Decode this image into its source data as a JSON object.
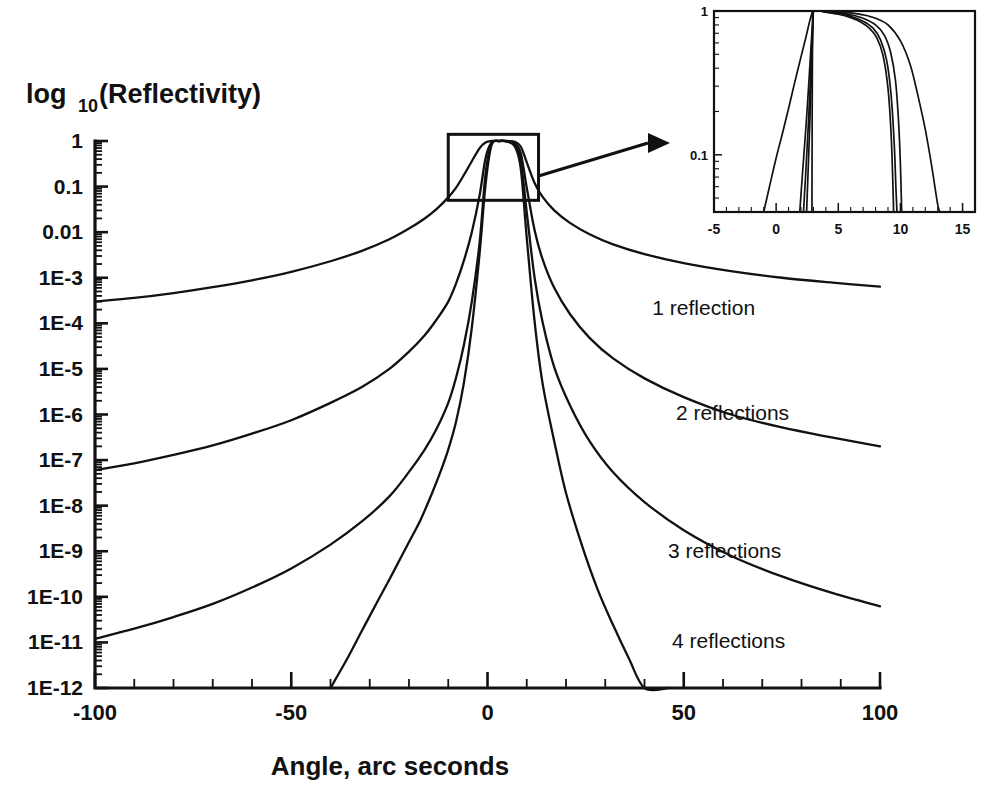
{
  "chart_data": {
    "type": "line",
    "title": "",
    "xlabel": "Angle, arc seconds",
    "ylabel": "log_10(Reflectivity)",
    "ylabel_parts": {
      "base": "log",
      "sub": "10",
      "rest": "(Reflectivity)"
    },
    "xlim": [
      -100,
      100
    ],
    "ylim": [
      1e-12,
      1
    ],
    "yscale": "log",
    "grid": false,
    "legend_position": "inline-annotations",
    "xticks": [
      -100,
      -50,
      0,
      50,
      100
    ],
    "xtick_labels": [
      "-100",
      "-50",
      "0",
      "50",
      "100"
    ],
    "xticks_minor_step": 10,
    "yticks": [
      1,
      0.1,
      0.01,
      0.001,
      0.0001,
      1e-05,
      1e-06,
      1e-07,
      1e-08,
      1e-09,
      1e-10,
      1e-11,
      1e-12
    ],
    "ytick_labels": [
      "1",
      "0.1",
      "0.01",
      "1E-3",
      "1E-4",
      "1E-5",
      "1E-6",
      "1E-7",
      "1E-8",
      "1E-9",
      "1E-10",
      "1E-11",
      "1E-12"
    ],
    "peak_angle": 3.0,
    "series": [
      {
        "name": "1 reflection",
        "label": "1 reflection",
        "label_angle": 42,
        "label_value": 0.00022,
        "points": [
          [
            -100,
            0.0003
          ],
          [
            -90,
            0.00036
          ],
          [
            -80,
            0.00046
          ],
          [
            -70,
            0.00062
          ],
          [
            -60,
            0.00088
          ],
          [
            -50,
            0.00135
          ],
          [
            -40,
            0.0023
          ],
          [
            -32,
            0.0039
          ],
          [
            -25,
            0.007
          ],
          [
            -20,
            0.012
          ],
          [
            -16,
            0.02
          ],
          [
            -13,
            0.032
          ],
          [
            -10,
            0.058
          ],
          [
            -8,
            0.095
          ],
          [
            -6,
            0.18
          ],
          [
            -4,
            0.36
          ],
          [
            -2,
            0.7
          ],
          [
            -0.5,
            0.93
          ],
          [
            1.0,
            1.0
          ],
          [
            3.0,
            1.0
          ],
          [
            5.0,
            1.0
          ],
          [
            7.0,
            0.96
          ],
          [
            8.5,
            0.75
          ],
          [
            10,
            0.34
          ],
          [
            12,
            0.12
          ],
          [
            14,
            0.06
          ],
          [
            17,
            0.03
          ],
          [
            21,
            0.016
          ],
          [
            26,
            0.009
          ],
          [
            32,
            0.0054
          ],
          [
            40,
            0.0033
          ],
          [
            50,
            0.0021
          ],
          [
            62,
            0.0014
          ],
          [
            75,
            0.001
          ],
          [
            88,
            0.00078
          ],
          [
            100,
            0.00064
          ]
        ]
      },
      {
        "name": "2 reflections",
        "label": "2 reflections",
        "label_angle": 48,
        "label_value": 1.1e-06,
        "points": [
          [
            -100,
            6e-08
          ],
          [
            -90,
            8.5e-08
          ],
          [
            -80,
            1.3e-07
          ],
          [
            -70,
            2.1e-07
          ],
          [
            -60,
            3.8e-07
          ],
          [
            -50,
            7.5e-07
          ],
          [
            -40,
            1.8e-06
          ],
          [
            -32,
            4e-06
          ],
          [
            -25,
            1e-05
          ],
          [
            -20,
            2.4e-05
          ],
          [
            -16,
            5.5e-05
          ],
          [
            -13,
            0.00012
          ],
          [
            -10,
            0.0003
          ],
          [
            -8,
            0.00075
          ],
          [
            -6,
            0.0024
          ],
          [
            -4,
            0.01
          ],
          [
            -2,
            0.065
          ],
          [
            -0.5,
            0.42
          ],
          [
            1.0,
            0.92
          ],
          [
            3.0,
            1.0
          ],
          [
            5.0,
            0.99
          ],
          [
            7.0,
            0.9
          ],
          [
            8.5,
            0.53
          ],
          [
            10,
            0.095
          ],
          [
            12,
            0.011
          ],
          [
            14,
            0.0026
          ],
          [
            17,
            0.0006
          ],
          [
            21,
            0.00016
          ],
          [
            26,
            4.8e-05
          ],
          [
            32,
            1.7e-05
          ],
          [
            40,
            6.2e-06
          ],
          [
            50,
            2.4e-06
          ],
          [
            62,
            1e-06
          ],
          [
            75,
            5.2e-07
          ],
          [
            88,
            3.1e-07
          ],
          [
            100,
            2e-07
          ]
        ]
      },
      {
        "name": "3 reflections",
        "label": "3 reflections",
        "label_angle": 46,
        "label_value": 1e-09,
        "points": [
          [
            -100,
            1.2e-11
          ],
          [
            -90,
            2e-11
          ],
          [
            -80,
            3.6e-11
          ],
          [
            -70,
            7e-11
          ],
          [
            -60,
            1.6e-10
          ],
          [
            -50,
            4.2e-10
          ],
          [
            -40,
            1.4e-09
          ],
          [
            -32,
            4.5e-09
          ],
          [
            -25,
            1.6e-08
          ],
          [
            -20,
            5.5e-08
          ],
          [
            -16,
            1.7e-07
          ],
          [
            -13,
            4.8e-07
          ],
          [
            -10,
            1.8e-06
          ],
          [
            -8,
            6.5e-06
          ],
          [
            -6,
            3.4e-05
          ],
          [
            -4,
            0.0003
          ],
          [
            -2,
            0.006
          ],
          [
            -0.5,
            0.19
          ],
          [
            1.0,
            0.85
          ],
          [
            3.0,
            1.0
          ],
          [
            5.0,
            0.98
          ],
          [
            7.0,
            0.83
          ],
          [
            8.5,
            0.37
          ],
          [
            10,
            0.027
          ],
          [
            12,
            0.001
          ],
          [
            14,
            0.00011
          ],
          [
            17,
            1.1e-05
          ],
          [
            21,
            1.6e-06
          ],
          [
            26,
            2.6e-07
          ],
          [
            32,
            5.4e-08
          ],
          [
            40,
            1.2e-08
          ],
          [
            50,
            2.9e-09
          ],
          [
            62,
            8e-10
          ],
          [
            75,
            2.8e-10
          ],
          [
            88,
            1.2e-10
          ],
          [
            100,
            6.2e-11
          ]
        ]
      },
      {
        "name": "4 reflections",
        "label": "4 reflections",
        "label_angle": 47,
        "label_value": 1.1e-11,
        "points": [
          [
            -40,
            1e-12
          ],
          [
            -36,
            4e-12
          ],
          [
            -32,
            1.8e-11
          ],
          [
            -28,
            8e-11
          ],
          [
            -25,
            2.4e-10
          ],
          [
            -22,
            7.5e-10
          ],
          [
            -20,
            1.6e-09
          ],
          [
            -17,
            5e-09
          ],
          [
            -14,
            2e-08
          ],
          [
            -12,
            5.5e-08
          ],
          [
            -10,
            1.7e-07
          ],
          [
            -8,
            7e-07
          ],
          [
            -6,
            5e-06
          ],
          [
            -4,
            8e-05
          ],
          [
            -2,
            0.0035
          ],
          [
            -0.5,
            0.11
          ],
          [
            1.0,
            0.8
          ],
          [
            3.0,
            1.0
          ],
          [
            5.0,
            0.97
          ],
          [
            7.0,
            0.75
          ],
          [
            8.5,
            0.24
          ],
          [
            10,
            0.0075
          ],
          [
            12,
            0.00011
          ],
          [
            14,
            5e-06
          ],
          [
            17,
            2.6e-07
          ],
          [
            20,
            1.9e-08
          ],
          [
            24,
            1.4e-09
          ],
          [
            28,
            1.5e-10
          ],
          [
            32,
            2.4e-11
          ],
          [
            36,
            4.5e-12
          ],
          [
            40,
            1e-12
          ],
          [
            46,
            1e-12
          ]
        ]
      }
    ],
    "zoom_box": {
      "x_range": [
        -10,
        13
      ],
      "y_range": [
        0.05,
        1.4
      ],
      "annotation": "zoom-region"
    },
    "inset": {
      "type": "line",
      "xlim": [
        -5,
        16
      ],
      "ylim": [
        0.04,
        1.0
      ],
      "yscale": "log",
      "xticks": [
        -5,
        0,
        5,
        10,
        15
      ],
      "xtick_labels": [
        "-5",
        "0",
        "5",
        "10",
        "15"
      ],
      "yticks": [
        1,
        0.1
      ],
      "ytick_labels": [
        "1",
        "0.1"
      ],
      "series": [
        {
          "name": "1 reflection",
          "points": [
            [
              -1.0,
              0.04
            ],
            [
              -0.5,
              0.062
            ],
            [
              0.0,
              0.095
            ],
            [
              0.5,
              0.14
            ],
            [
              1.0,
              0.21
            ],
            [
              1.5,
              0.32
            ],
            [
              2.0,
              0.48
            ],
            [
              2.4,
              0.66
            ],
            [
              2.7,
              0.85
            ],
            [
              2.9,
              0.97
            ],
            [
              3.0,
              1.0
            ],
            [
              4.0,
              0.995
            ],
            [
              5.0,
              0.985
            ],
            [
              6.0,
              0.97
            ],
            [
              7.0,
              0.94
            ],
            [
              8.0,
              0.89
            ],
            [
              9.0,
              0.8
            ],
            [
              10.0,
              0.62
            ],
            [
              10.8,
              0.42
            ],
            [
              11.4,
              0.26
            ],
            [
              12.0,
              0.15
            ],
            [
              12.5,
              0.085
            ],
            [
              13.0,
              0.045
            ],
            [
              13.2,
              0.04
            ]
          ]
        },
        {
          "name": "2 reflections",
          "points": [
            [
              1.9,
              0.04
            ],
            [
              2.1,
              0.07
            ],
            [
              2.3,
              0.12
            ],
            [
              2.5,
              0.21
            ],
            [
              2.7,
              0.4
            ],
            [
              2.85,
              0.65
            ],
            [
              2.95,
              0.88
            ],
            [
              3.0,
              1.0
            ],
            [
              4.0,
              0.99
            ],
            [
              5.0,
              0.97
            ],
            [
              6.0,
              0.94
            ],
            [
              7.0,
              0.89
            ],
            [
              8.0,
              0.8
            ],
            [
              8.7,
              0.68
            ],
            [
              9.2,
              0.52
            ],
            [
              9.6,
              0.33
            ],
            [
              9.85,
              0.17
            ],
            [
              10.0,
              0.085
            ],
            [
              10.1,
              0.04
            ]
          ]
        },
        {
          "name": "3 reflections",
          "points": [
            [
              2.2,
              0.04
            ],
            [
              2.4,
              0.08
            ],
            [
              2.6,
              0.17
            ],
            [
              2.75,
              0.32
            ],
            [
              2.87,
              0.58
            ],
            [
              2.95,
              0.85
            ],
            [
              3.0,
              1.0
            ],
            [
              4.0,
              0.985
            ],
            [
              5.0,
              0.96
            ],
            [
              6.0,
              0.92
            ],
            [
              7.0,
              0.85
            ],
            [
              7.8,
              0.76
            ],
            [
              8.4,
              0.63
            ],
            [
              8.9,
              0.45
            ],
            [
              9.25,
              0.26
            ],
            [
              9.5,
              0.12
            ],
            [
              9.65,
              0.055
            ],
            [
              9.72,
              0.04
            ]
          ]
        },
        {
          "name": "4 reflections",
          "points": [
            [
              2.45,
              0.04
            ],
            [
              2.6,
              0.09
            ],
            [
              2.75,
              0.21
            ],
            [
              2.87,
              0.44
            ],
            [
              2.95,
              0.78
            ],
            [
              3.0,
              1.0
            ],
            [
              4.0,
              0.98
            ],
            [
              5.0,
              0.95
            ],
            [
              6.0,
              0.9
            ],
            [
              6.8,
              0.84
            ],
            [
              7.5,
              0.76
            ],
            [
              8.1,
              0.65
            ],
            [
              8.6,
              0.49
            ],
            [
              9.0,
              0.29
            ],
            [
              9.25,
              0.14
            ],
            [
              9.4,
              0.06
            ],
            [
              9.45,
              0.04
            ]
          ]
        },
        {
          "name": "vertical-edge",
          "points": [
            [
              2.88,
              0.04
            ],
            [
              2.9,
              0.2
            ],
            [
              2.92,
              0.5
            ],
            [
              2.95,
              0.8
            ],
            [
              3.0,
              1.0
            ]
          ]
        }
      ]
    }
  },
  "colors": {
    "ink": "#111111",
    "background": "#ffffff"
  }
}
